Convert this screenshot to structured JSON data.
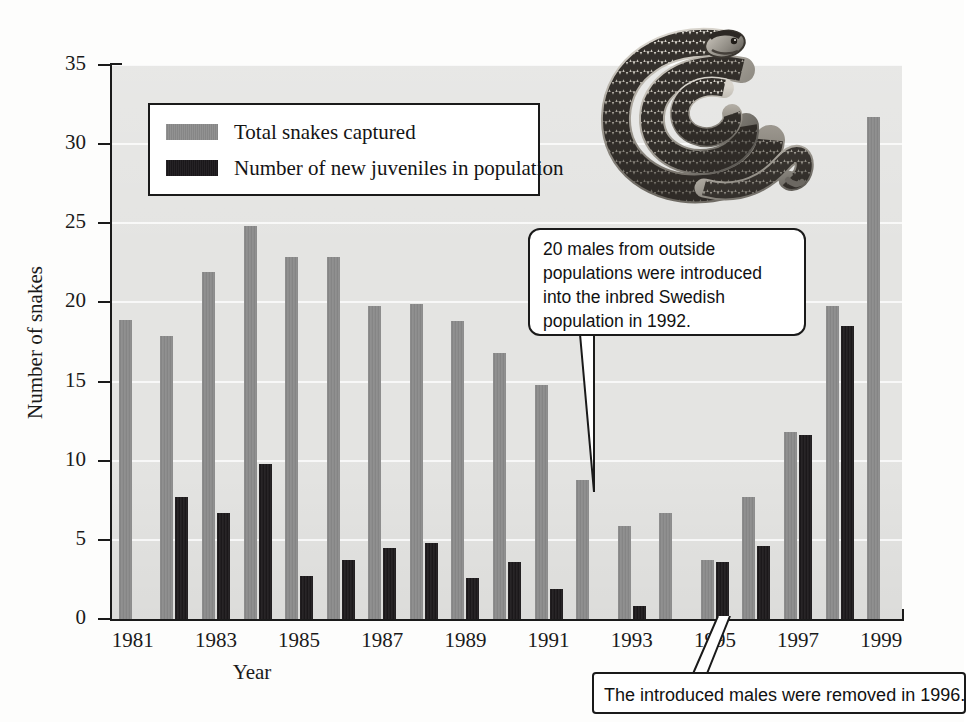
{
  "chart_data": {
    "type": "bar",
    "title": "",
    "xlabel": "Year",
    "ylabel": "Number of snakes",
    "ylim": [
      0,
      35
    ],
    "yticks": [
      0,
      5,
      10,
      15,
      20,
      25,
      30,
      35
    ],
    "grid": true,
    "legend_position": "top-left",
    "categories": [
      1981,
      1982,
      1983,
      1984,
      1985,
      1986,
      1987,
      1988,
      1989,
      1990,
      1991,
      1992,
      1993,
      1994,
      1995,
      1996,
      1997,
      1998,
      1999
    ],
    "xtick_labels": [
      "1981",
      "1983",
      "1985",
      "1987",
      "1989",
      "1991",
      "1993",
      "1995",
      "1997",
      "1999"
    ],
    "series": [
      {
        "name": "Total snakes captured",
        "color": "#8b8b8b",
        "values": [
          18.9,
          17.9,
          21.9,
          24.8,
          22.9,
          22.9,
          19.8,
          19.9,
          18.8,
          16.8,
          14.8,
          8.8,
          5.9,
          6.7,
          3.7,
          7.7,
          11.8,
          19.8,
          31.7
        ]
      },
      {
        "name": "Number of new juveniles in population",
        "color": "#211e20",
        "values": [
          0,
          7.7,
          6.7,
          9.8,
          2.7,
          3.7,
          4.5,
          4.8,
          2.6,
          3.6,
          1.9,
          0,
          0.8,
          0,
          3.6,
          4.6,
          11.6,
          18.5,
          0
        ]
      }
    ],
    "series_juvenile_by_year": {
      "1982": 7.7,
      "1983": 6.7,
      "1984": 9.8,
      "1985": 2.7,
      "1986": 3.7,
      "1987": 4.5,
      "1988": 4.8,
      "1989": 2.6,
      "1990": 3.6,
      "1991": 1.9,
      "1993": 0.8,
      "1996": 3.6,
      "1997": 4.6,
      "1998": 11.6,
      "1999": 18.5
    },
    "annotations": [
      "20 males from outside populations were introduced into the inbred Swedish population in 1992.",
      "The introduced males were removed in 1996."
    ]
  },
  "legend": {
    "items": [
      {
        "label": "Total snakes captured",
        "swatch": "total"
      },
      {
        "label": "Number of new juveniles in population",
        "swatch": "juv"
      }
    ]
  },
  "axes": {
    "y_title": "Number of snakes",
    "x_title": "Year",
    "y_tick_labels": [
      "0",
      "5",
      "10",
      "15",
      "20",
      "25",
      "30",
      "35"
    ],
    "x_tick_labels": [
      "1981",
      "1983",
      "1985",
      "1987",
      "1989",
      "1991",
      "1993",
      "1995",
      "1997",
      "1999"
    ]
  },
  "callouts": {
    "intro": "20 males from outside populations were introduced into the inbred Swedish population in 1992.",
    "removed": "The introduced males were removed in 1996."
  },
  "artwork": {
    "snake_caption": "adder-snake-illustration"
  }
}
